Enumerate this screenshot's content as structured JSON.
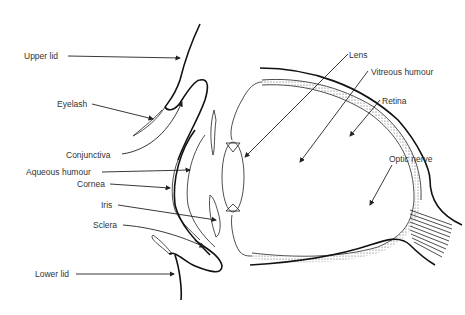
{
  "diagram": {
    "labels": {
      "upper_lid": "Upper lid",
      "eyelash": "Eyelash",
      "conjunctiva": "Conjunctiva",
      "aqueous_humour": "Aqueous humour",
      "cornea": "Cornea",
      "iris": "Iris",
      "sclera": "Sclera",
      "lower_lid": "Lower lid",
      "lens": "Lens",
      "vitreous_humour": "Vitreous humour",
      "retina": "Retina",
      "optic_nerve": "Optic nerve"
    },
    "colors": {
      "line": "#222222",
      "text": "#333333",
      "background": "#ffffff"
    }
  }
}
